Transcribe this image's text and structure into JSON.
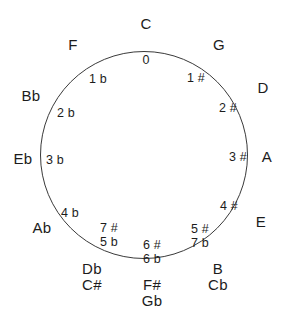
{
  "diagram": {
    "type": "circle-of-fifths",
    "background_color": "#ffffff",
    "stroke_color": "#3a3a3a",
    "text_color": "#1c1c1c",
    "circle": {
      "center_x": 144,
      "center_y": 155,
      "radius": 104
    },
    "keys": [
      {
        "id": "c",
        "position": "top",
        "clock": 12,
        "outer_label": "C",
        "outer_x": 146,
        "outer_y": 24,
        "inner_label": "0",
        "inner_x": 146,
        "inner_y": 60
      },
      {
        "id": "g",
        "position": "upper-right",
        "clock": 1,
        "outer_label": "G",
        "outer_x": 219,
        "outer_y": 45,
        "inner_label": "1 #",
        "inner_x": 196,
        "inner_y": 78
      },
      {
        "id": "d",
        "position": "right-upper",
        "clock": 2,
        "outer_label": "D",
        "outer_x": 263,
        "outer_y": 88,
        "inner_label": "2 #",
        "inner_x": 228,
        "inner_y": 108
      },
      {
        "id": "a",
        "position": "right",
        "clock": 3,
        "outer_label": "A",
        "outer_x": 267,
        "outer_y": 157,
        "inner_label": "3 #",
        "inner_x": 238,
        "inner_y": 157
      },
      {
        "id": "e",
        "position": "lower-right",
        "clock": 4,
        "outer_label": "E",
        "outer_x": 261,
        "outer_y": 222,
        "inner_label": "4 #",
        "inner_x": 229,
        "inner_y": 206
      },
      {
        "id": "b-cb",
        "position": "bottom-right",
        "clock": 5,
        "outer_label": "B\nCb",
        "outer_lines": [
          "B",
          "Cb"
        ],
        "outer_x": 218,
        "outer_y": 277,
        "inner_label": "5 #\n7 b",
        "inner_lines": [
          "5 #",
          "7 b"
        ],
        "inner_x": 200,
        "inner_y": 236
      },
      {
        "id": "fsharp-gb",
        "position": "bottom",
        "clock": 6,
        "outer_label": "F#\nGb",
        "outer_lines": [
          "F#",
          "Gb"
        ],
        "outer_x": 152,
        "outer_y": 293,
        "inner_label": "6 #\n6 b",
        "inner_lines": [
          "6 #",
          "6 b"
        ],
        "inner_x": 152,
        "inner_y": 252
      },
      {
        "id": "db-csharp",
        "position": "bottom-left",
        "clock": 7,
        "outer_label": "Db\nC#",
        "outer_lines": [
          "Db",
          "C#"
        ],
        "outer_x": 92,
        "outer_y": 277,
        "inner_label": "7 #\n5 b",
        "inner_lines": [
          "7 #",
          "5 b"
        ],
        "inner_x": 109,
        "inner_y": 235
      },
      {
        "id": "ab",
        "position": "lower-left",
        "clock": 8,
        "outer_label": "Ab",
        "outer_x": 42,
        "outer_y": 228,
        "inner_label": "4 b",
        "inner_x": 70,
        "inner_y": 213
      },
      {
        "id": "eb",
        "position": "left",
        "clock": 9,
        "outer_label": "Eb",
        "outer_x": 23,
        "outer_y": 159,
        "inner_label": "3 b",
        "inner_x": 55,
        "inner_y": 160
      },
      {
        "id": "bb",
        "position": "left-upper",
        "clock": 10,
        "outer_label": "Bb",
        "outer_x": 31,
        "outer_y": 96,
        "inner_label": "2 b",
        "inner_x": 66,
        "inner_y": 113
      },
      {
        "id": "f",
        "position": "upper-left",
        "clock": 11,
        "outer_label": "F",
        "outer_x": 73,
        "outer_y": 45,
        "inner_label": "1 b",
        "inner_x": 98,
        "inner_y": 79
      }
    ]
  }
}
